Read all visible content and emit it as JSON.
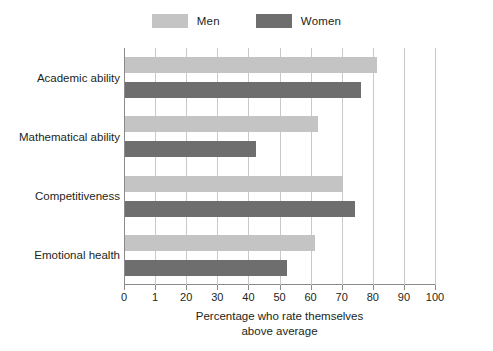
{
  "chart_data": {
    "type": "bar",
    "orientation": "horizontal",
    "title": "",
    "xlabel": "Percentage who rate themselves above average",
    "xlabel_lines": [
      "Percentage who rate themselves",
      "above average"
    ],
    "ylabel": "",
    "categories": [
      "Academic ability",
      "Mathematical ability",
      "Competitiveness",
      "Emotional health"
    ],
    "series": [
      {
        "name": "Men",
        "color": "#c4c4c4",
        "values": [
          81,
          62,
          70,
          61
        ]
      },
      {
        "name": "Women",
        "color": "#6e6e6e",
        "values": [
          76,
          42,
          74,
          52
        ]
      }
    ],
    "xlim": [
      0,
      100
    ],
    "xticks": [
      0,
      10,
      20,
      30,
      40,
      50,
      60,
      70,
      80,
      90,
      100
    ],
    "xtick_labels": [
      "0",
      "1",
      "20",
      "30",
      "40",
      "50",
      "60",
      "70",
      "80",
      "90",
      "100"
    ],
    "grid": "vertical",
    "legend_position": "top-center"
  },
  "legend": {
    "entries": [
      {
        "label": "Men",
        "color": "#c4c4c4"
      },
      {
        "label": "Women",
        "color": "#6e6e6e"
      }
    ]
  },
  "colors": {
    "men": "#c4c4c4",
    "women": "#6e6e6e",
    "axis": "#8a8a8a",
    "grid": "#c9c9c9",
    "text": "#231f20",
    "background": "#ffffff"
  }
}
